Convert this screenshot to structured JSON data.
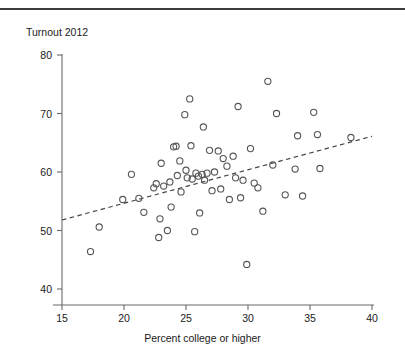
{
  "page": {
    "header_cut_text": "",
    "title": "Turnout 2012"
  },
  "axes": {
    "y_title": "Turnout 2012",
    "x_title": "Percent college or higher",
    "y_ticks": [
      "80",
      "70",
      "60",
      "50",
      "40"
    ],
    "x_ticks": [
      "15",
      "20",
      "25",
      "30",
      "35",
      "40"
    ]
  },
  "colors": {
    "rule": "#3c3c3c",
    "axis": "#6b6b6b",
    "marker": "#555555",
    "trend": "#444444",
    "text": "#1a1a1a"
  },
  "chart_data": {
    "type": "scatter",
    "title": "Turnout 2012",
    "xlabel": "Percent college or higher",
    "ylabel": "Turnout 2012",
    "xlim": [
      15,
      40
    ],
    "ylim": [
      40,
      80
    ],
    "xticks": [
      15,
      20,
      25,
      30,
      35,
      40
    ],
    "yticks": [
      40,
      50,
      60,
      70,
      80
    ],
    "grid": false,
    "legend": null,
    "marker": "open-circle",
    "trendline": {
      "type": "linear-dashed",
      "x_start": 15,
      "y_start": 51.8,
      "x_end": 40,
      "y_end": 66.1
    },
    "points": [
      {
        "x": 17.3,
        "y": 46.4
      },
      {
        "x": 18.0,
        "y": 50.6
      },
      {
        "x": 19.9,
        "y": 55.3
      },
      {
        "x": 20.6,
        "y": 59.6
      },
      {
        "x": 21.2,
        "y": 55.5
      },
      {
        "x": 21.6,
        "y": 53.1
      },
      {
        "x": 22.4,
        "y": 57.3
      },
      {
        "x": 22.6,
        "y": 58.0
      },
      {
        "x": 22.8,
        "y": 48.8
      },
      {
        "x": 22.9,
        "y": 52.0
      },
      {
        "x": 23.0,
        "y": 61.5
      },
      {
        "x": 23.2,
        "y": 57.6
      },
      {
        "x": 23.5,
        "y": 50.0
      },
      {
        "x": 23.7,
        "y": 58.3
      },
      {
        "x": 23.8,
        "y": 54.0
      },
      {
        "x": 24.0,
        "y": 64.3
      },
      {
        "x": 24.2,
        "y": 64.4
      },
      {
        "x": 24.3,
        "y": 59.4
      },
      {
        "x": 24.5,
        "y": 61.9
      },
      {
        "x": 24.6,
        "y": 56.6
      },
      {
        "x": 24.9,
        "y": 69.8
      },
      {
        "x": 25.0,
        "y": 60.3
      },
      {
        "x": 25.1,
        "y": 59.0
      },
      {
        "x": 25.3,
        "y": 72.5
      },
      {
        "x": 25.4,
        "y": 64.5
      },
      {
        "x": 25.5,
        "y": 58.8
      },
      {
        "x": 25.7,
        "y": 49.8
      },
      {
        "x": 25.8,
        "y": 59.8
      },
      {
        "x": 26.0,
        "y": 59.3
      },
      {
        "x": 26.1,
        "y": 53.0
      },
      {
        "x": 26.3,
        "y": 59.6
      },
      {
        "x": 26.4,
        "y": 67.7
      },
      {
        "x": 26.5,
        "y": 58.6
      },
      {
        "x": 26.7,
        "y": 59.8
      },
      {
        "x": 26.9,
        "y": 63.7
      },
      {
        "x": 27.1,
        "y": 56.8
      },
      {
        "x": 27.3,
        "y": 60.0
      },
      {
        "x": 27.6,
        "y": 63.6
      },
      {
        "x": 27.8,
        "y": 57.1
      },
      {
        "x": 28.0,
        "y": 62.3
      },
      {
        "x": 28.3,
        "y": 61.0
      },
      {
        "x": 28.5,
        "y": 55.3
      },
      {
        "x": 28.8,
        "y": 62.7
      },
      {
        "x": 29.0,
        "y": 59.0
      },
      {
        "x": 29.2,
        "y": 71.2
      },
      {
        "x": 29.4,
        "y": 55.6
      },
      {
        "x": 29.6,
        "y": 58.6
      },
      {
        "x": 29.9,
        "y": 44.2
      },
      {
        "x": 30.2,
        "y": 64.0
      },
      {
        "x": 30.5,
        "y": 58.1
      },
      {
        "x": 30.8,
        "y": 57.3
      },
      {
        "x": 31.2,
        "y": 53.3
      },
      {
        "x": 31.6,
        "y": 75.5
      },
      {
        "x": 32.0,
        "y": 61.2
      },
      {
        "x": 32.3,
        "y": 70.0
      },
      {
        "x": 33.0,
        "y": 56.1
      },
      {
        "x": 33.8,
        "y": 60.5
      },
      {
        "x": 34.0,
        "y": 66.2
      },
      {
        "x": 34.4,
        "y": 55.9
      },
      {
        "x": 35.3,
        "y": 70.2
      },
      {
        "x": 35.6,
        "y": 66.4
      },
      {
        "x": 35.8,
        "y": 60.6
      },
      {
        "x": 38.3,
        "y": 65.9
      }
    ]
  }
}
